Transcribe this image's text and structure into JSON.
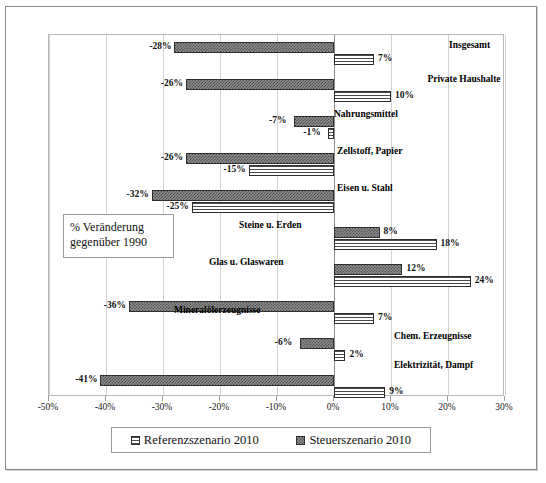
{
  "annotation": {
    "line1": "% Veränderung",
    "line2": "gegenüber 1990"
  },
  "legend": {
    "items": [
      {
        "label": "Referenzszenario 2010",
        "pattern": "horizontal-lines",
        "color": "#ffffff"
      },
      {
        "label": "Steuerszenario 2010",
        "pattern": "checkered",
        "color": "#8d8d8d"
      }
    ]
  },
  "axis": {
    "ticks": [
      "-50%",
      "-40%",
      "-30%",
      "-20%",
      "-10%",
      "0%",
      "10%",
      "20%",
      "30%"
    ],
    "tick_values": [
      -50,
      -40,
      -30,
      -20,
      -10,
      0,
      10,
      20,
      30
    ]
  },
  "chart_data": {
    "type": "bar",
    "orientation": "horizontal",
    "title": "",
    "subtitle": "",
    "xlabel": "% Veränderung gegenüber 1990",
    "ylabel": "",
    "xlim": [
      -50,
      30
    ],
    "grid": true,
    "legend_position": "bottom",
    "categories": [
      "Insgesamt",
      "Private Haushalte",
      "Nahrungsmittel",
      "Zellstoff, Papier",
      "Eisen u. Stahl",
      "Steine u. Erden",
      "Glas u. Glaswaren",
      "Mineralölerzeugnisse",
      "Chem. Erzeugnisse",
      "Elektrizität, Dampf"
    ],
    "series": [
      {
        "name": "Steuerszenario 2010",
        "values": [
          -28,
          -26,
          -7,
          -26,
          -32,
          8,
          12,
          -36,
          -6,
          -41
        ],
        "labels": [
          "-28%",
          "-26%",
          "-7%",
          "-26%",
          "-32%",
          "8%",
          "12%",
          "-36%",
          "-6%",
          "-41%"
        ]
      },
      {
        "name": "Referenzszenario 2010",
        "values": [
          7,
          10,
          -1,
          -15,
          -25,
          18,
          24,
          7,
          2,
          9
        ],
        "labels": [
          "7%",
          "10%",
          "-1%",
          "-15%",
          "-25%",
          "18%",
          "24%",
          "7%",
          "2%",
          "9%"
        ]
      }
    ]
  }
}
